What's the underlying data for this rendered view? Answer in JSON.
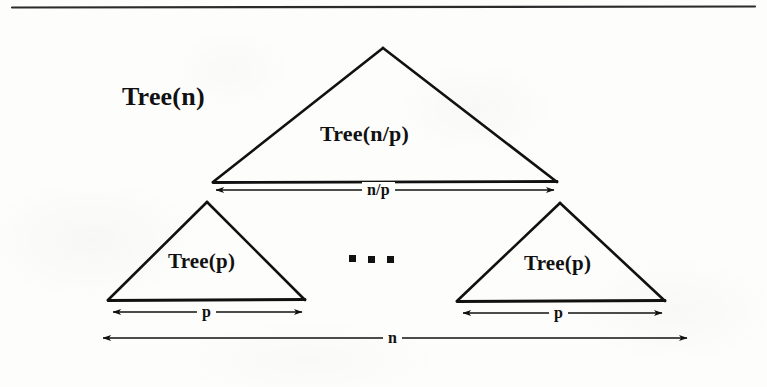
{
  "figure": {
    "kind": "recursion-tree-diagram",
    "background_color": "#fdfdfc",
    "ink_color": "#111111",
    "top_rule": {
      "x1": 12,
      "y1": 7,
      "x2": 755,
      "y2": 7
    },
    "labels": {
      "tree_n": "Tree(n)",
      "tree_n_over_p": "Tree(n/p)",
      "tree_p_left": "Tree(p)",
      "tree_p_right": "Tree(p)",
      "measure_n_over_p": "n/p",
      "measure_p_left": "p",
      "measure_p_right": "p",
      "measure_n": "n",
      "ellipsis": "..."
    },
    "triangles": {
      "root": {
        "apex_x": 383,
        "apex_y": 48,
        "base_left_x": 213,
        "base_right_x": 557,
        "base_y": 182
      },
      "left_child": {
        "apex_x": 207,
        "apex_y": 202,
        "base_left_x": 108,
        "base_right_x": 305,
        "base_y": 300
      },
      "right_child": {
        "apex_x": 560,
        "apex_y": 203,
        "base_left_x": 457,
        "base_right_x": 665,
        "base_y": 301
      }
    },
    "dimension_arrows": [
      {
        "name": "n-over-p",
        "x1": 213,
        "x2": 557,
        "y": 190,
        "label": "n/p"
      },
      {
        "name": "p-left",
        "x1": 110,
        "x2": 305,
        "y": 312,
        "label": "p"
      },
      {
        "name": "p-right",
        "x1": 460,
        "x2": 665,
        "y": 313,
        "label": "p"
      },
      {
        "name": "n",
        "x1": 100,
        "x2": 690,
        "y": 338,
        "label": "n"
      }
    ],
    "ellipsis_dots": [
      {
        "x": 352,
        "y": 258,
        "size": 7
      },
      {
        "x": 371,
        "y": 259,
        "size": 7
      },
      {
        "x": 390,
        "y": 259,
        "size": 7
      }
    ]
  }
}
